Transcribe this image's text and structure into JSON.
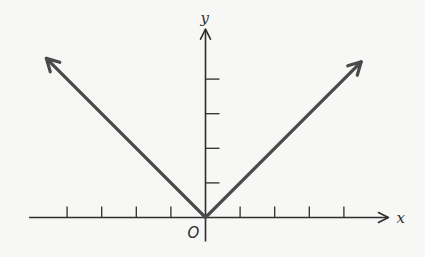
{
  "chart_data": {
    "type": "line",
    "title": "",
    "function": "y = |x|",
    "xlabel": "x",
    "ylabel": "y",
    "origin_label": "O",
    "xlim": [
      -5.1,
      5.2
    ],
    "ylim": [
      0,
      5.5
    ],
    "x_ticks": [
      -4,
      -3,
      -2,
      -1,
      1,
      2,
      3,
      4
    ],
    "y_ticks": [
      1,
      2,
      3,
      4
    ],
    "tick_labels_shown": false,
    "grid": false,
    "series": [
      {
        "name": "y = |x|",
        "x": [
          -4.6,
          0,
          4.5
        ],
        "y": [
          4.6,
          0,
          4.5
        ],
        "arrows_at_ends": true
      }
    ],
    "colors": {
      "axis": "#2e2e2e",
      "graph": "#4a4a4a"
    }
  }
}
